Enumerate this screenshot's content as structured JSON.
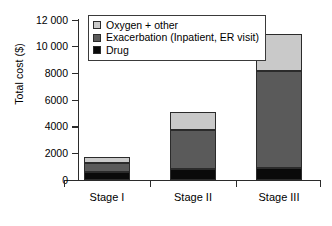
{
  "chart": {
    "type": "bar",
    "title": "",
    "ylabel": "Total cost ($)",
    "xlabel": ""
  },
  "legend": {
    "position": "top-left-inside",
    "items": [
      {
        "label": "Oxygen + other",
        "color": "#c9c9c9"
      },
      {
        "label": "Exacerbation (Inpatient, ER visit)",
        "color": "#5a5a5a"
      },
      {
        "label": "Drug",
        "color": "#0a0a0a"
      }
    ]
  },
  "yaxis": {
    "ticks": [
      {
        "label": "12 000",
        "value": 12000
      },
      {
        "label": "10 000",
        "value": 10000
      },
      {
        "label": "8000",
        "value": 8000
      },
      {
        "label": "6000",
        "value": 6000
      },
      {
        "label": "4000",
        "value": 4000
      },
      {
        "label": "2000",
        "value": 2000
      },
      {
        "label": "0",
        "value": 0
      }
    ]
  },
  "chart_data": {
    "type": "bar",
    "stacked": true,
    "title": "",
    "xlabel": "",
    "ylabel": "Total cost ($)",
    "categories": [
      "Stage I",
      "Stage II",
      "Stage III"
    ],
    "series": [
      {
        "name": "Drug",
        "color": "#0a0a0a",
        "values": [
          600,
          820,
          900
        ]
      },
      {
        "name": "Exacerbation (Inpatient, ER visit)",
        "color": "#5a5a5a",
        "values": [
          700,
          2930,
          7300
        ]
      },
      {
        "name": "Oxygen + other",
        "color": "#c9c9c9",
        "values": [
          450,
          1350,
          2760
        ]
      }
    ],
    "totals": [
      1750,
      5100,
      10960
    ],
    "ylim": [
      0,
      12000
    ],
    "ytick_values": [
      0,
      2000,
      4000,
      6000,
      8000,
      10000,
      12000
    ],
    "ytick_labels": [
      "0",
      "2000",
      "4000",
      "6000",
      "8000",
      "10 000",
      "12 000"
    ],
    "grid": false,
    "legend_position": "upper left"
  },
  "caption": {
    "clipped_text": ""
  }
}
